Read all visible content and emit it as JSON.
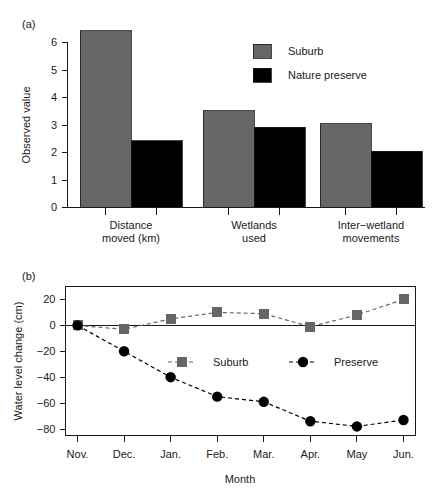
{
  "figure": {
    "panel_a_tag": "(a)",
    "panel_b_tag": "(b)"
  },
  "colors": {
    "suburb": "#666666",
    "preserve": "#000000",
    "axis": "#1a1a1a",
    "background": "#ffffff"
  },
  "chart_data": [
    {
      "id": "panel-a",
      "type": "bar",
      "title": "",
      "xlabel": "",
      "ylabel": "Observed value",
      "ylim": [
        0,
        6.6
      ],
      "yticks": [
        0,
        1,
        2,
        3,
        4,
        5,
        6
      ],
      "ytick_labels": [
        "0",
        "1",
        "2",
        "3",
        "4",
        "5",
        "6"
      ],
      "grid": false,
      "legend_position": "top-right",
      "categories": [
        "Distance moved (km)",
        "Wetlands used",
        "Inter−wetland movements"
      ],
      "category_lines": [
        [
          "Distance",
          "moved (km)"
        ],
        [
          "Wetlands",
          "used"
        ],
        [
          "Inter−wetland",
          "movements"
        ]
      ],
      "series": [
        {
          "name": "Suburb",
          "color": "#666666",
          "values": [
            6.42,
            3.52,
            3.05
          ]
        },
        {
          "name": "Nature preserve",
          "color": "#000000",
          "values": [
            2.42,
            2.92,
            2.05
          ]
        }
      ]
    },
    {
      "id": "panel-b",
      "type": "line",
      "title": "",
      "xlabel": "Month",
      "ylabel": "Water level change (cm)",
      "ylim": [
        -85,
        30
      ],
      "yticks": [
        20,
        0,
        -20,
        -40,
        -60,
        -80
      ],
      "ytick_labels": [
        "20",
        "0",
        "−20",
        "−40",
        "−60",
        "−80"
      ],
      "grid": false,
      "legend_position": "inside-center",
      "x": [
        "Nov.",
        "Dec.",
        "Jan.",
        "Feb.",
        "Mar.",
        "Apr.",
        "May",
        "Jun."
      ],
      "series": [
        {
          "name": "Suburb",
          "color": "#666666",
          "marker": "square",
          "linestyle": "dashed",
          "values": [
            0,
            -3,
            5,
            10,
            9,
            -1,
            8,
            20
          ]
        },
        {
          "name": "Preserve",
          "color": "#000000",
          "marker": "circle",
          "linestyle": "dashed",
          "values": [
            0,
            -20,
            -40,
            -55,
            -59,
            -74,
            -78,
            -73
          ]
        }
      ]
    }
  ]
}
